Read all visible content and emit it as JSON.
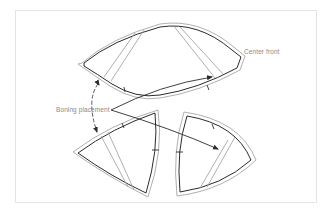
{
  "figure": {
    "labels": {
      "center_front": "Center front",
      "boning_placement": "Boning placement"
    },
    "pieces": [
      {
        "name": "upper-cup-piece",
        "boning_channels": 2
      },
      {
        "name": "lower-left-cup-piece",
        "boning_channels": 1
      },
      {
        "name": "lower-right-cup-piece",
        "boning_channels": 1
      }
    ],
    "colors": {
      "outline": "#2b2b2b",
      "seam_allowance": "#9a9a9a",
      "label_text": "#8a8a8a",
      "frame": "#e4e4e4"
    }
  }
}
